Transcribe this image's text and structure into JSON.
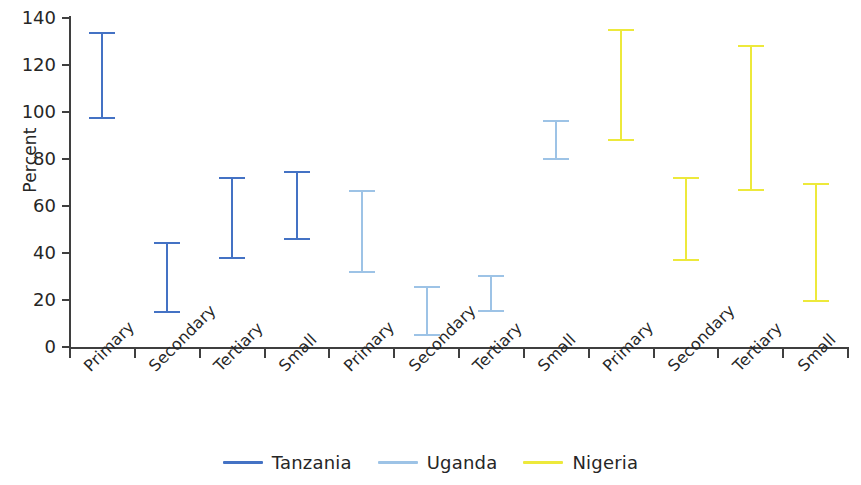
{
  "chart_data": {
    "type": "bar",
    "subtype": "error-bar-range",
    "title": "",
    "xlabel": "",
    "ylabel": "Percent",
    "ylim": [
      0,
      140
    ],
    "ytick_values": [
      0,
      20,
      40,
      60,
      80,
      100,
      120,
      140
    ],
    "ytick_labels": [
      "0",
      "20",
      "40",
      "60",
      "80",
      "100",
      "120",
      "140"
    ],
    "grid": false,
    "legend_position": "bottom-center",
    "categories": [
      "Primary",
      "Secondary",
      "Tertiary",
      "Small",
      "Primary",
      "Secondary",
      "Tertiary",
      "Small",
      "Primary",
      "Secondary",
      "Tertiary",
      "Small"
    ],
    "series": [
      {
        "name": "Tanzania",
        "color": "#4472C4",
        "categories": [
          "Primary",
          "Secondary",
          "Tertiary",
          "Small"
        ],
        "low": [
          97,
          14.5,
          37.5,
          45.5
        ],
        "high": [
          134,
          44.5,
          72.5,
          75
        ]
      },
      {
        "name": "Uganda",
        "color": "#9DC3E6",
        "categories": [
          "Primary",
          "Secondary",
          "Tertiary",
          "Small"
        ],
        "low": [
          31.5,
          4.5,
          15,
          79.5
        ],
        "high": [
          67,
          26,
          30.5,
          96.5
        ]
      },
      {
        "name": "Nigeria",
        "color": "#EDE93B",
        "categories": [
          "Primary",
          "Secondary",
          "Tertiary",
          "Small"
        ],
        "low": [
          87.5,
          36.5,
          66.5,
          19
        ],
        "high": [
          135.5,
          72.5,
          128.5,
          70
        ]
      }
    ],
    "legend": [
      {
        "label": "Tanzania",
        "color": "#4472C4"
      },
      {
        "label": "Uganda",
        "color": "#9DC3E6"
      },
      {
        "label": "Nigeria",
        "color": "#EDE93B"
      }
    ],
    "axis_color": "#3f3f3f"
  }
}
